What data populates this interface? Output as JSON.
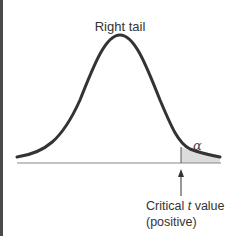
{
  "diagram": {
    "title": "Right tail",
    "alpha_label": "α",
    "critical_label_prefix": "Critical ",
    "critical_label_var": "t",
    "critical_label_suffix": " value",
    "critical_label_line2": "(positive)",
    "shade_color": "#dcdcdc",
    "curve_color": "#333333"
  }
}
